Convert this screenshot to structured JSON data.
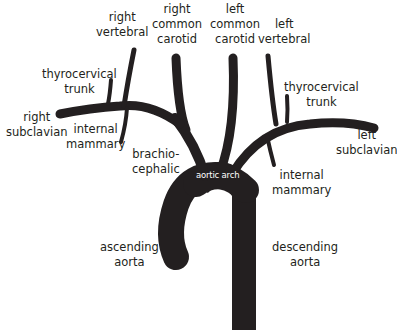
{
  "diagram": {
    "vessel_color": "#231f20",
    "arch_label_color": "#ffffff",
    "labels": {
      "right_vertebral": [
        "right",
        "vertebral"
      ],
      "right_common_carotid": [
        "right",
        "common",
        "carotid"
      ],
      "left_common_carotid": [
        "left",
        "common",
        "carotid"
      ],
      "left_vertebral": [
        "left",
        "vertebral"
      ],
      "right_thyrocervical_trunk": [
        "thyrocervical",
        "trunk"
      ],
      "left_thyrocervical_trunk": [
        "thyrocervical",
        "trunk"
      ],
      "right_subclavian": [
        "right",
        "subclavian"
      ],
      "left_subclavian": [
        "left",
        "subclavian"
      ],
      "right_internal_mammary": [
        "internal",
        "mammary"
      ],
      "left_internal_mammary": [
        "internal",
        "mammary"
      ],
      "brachiocephalic": [
        "brachio-",
        "cephalic"
      ],
      "aortic_arch": "aortic arch",
      "ascending_aorta": [
        "ascending",
        "aorta"
      ],
      "descending_aorta": [
        "descending",
        "aorta"
      ]
    }
  }
}
